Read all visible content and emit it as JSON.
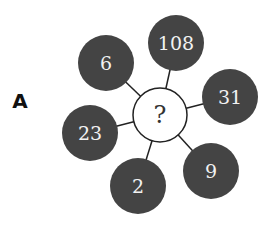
{
  "label": "A",
  "center": {
    "text": "?",
    "x": 160,
    "y": 115,
    "r": 27
  },
  "colors": {
    "outer_fill": "#444444",
    "center_fill": "#ffffff",
    "stroke": "#222222",
    "text": "#f2f2f2"
  },
  "outer": [
    {
      "text": "108",
      "x": 176,
      "y": 43
    },
    {
      "text": "6",
      "x": 106,
      "y": 63
    },
    {
      "text": "31",
      "x": 230,
      "y": 97
    },
    {
      "text": "23",
      "x": 90,
      "y": 133
    },
    {
      "text": "9",
      "x": 211,
      "y": 171
    },
    {
      "text": "2",
      "x": 138,
      "y": 186
    }
  ]
}
